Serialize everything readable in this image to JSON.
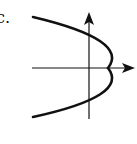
{
  "figure": {
    "label": "c.",
    "colors": {
      "stroke": "#111111",
      "background": "#ffffff"
    }
  }
}
